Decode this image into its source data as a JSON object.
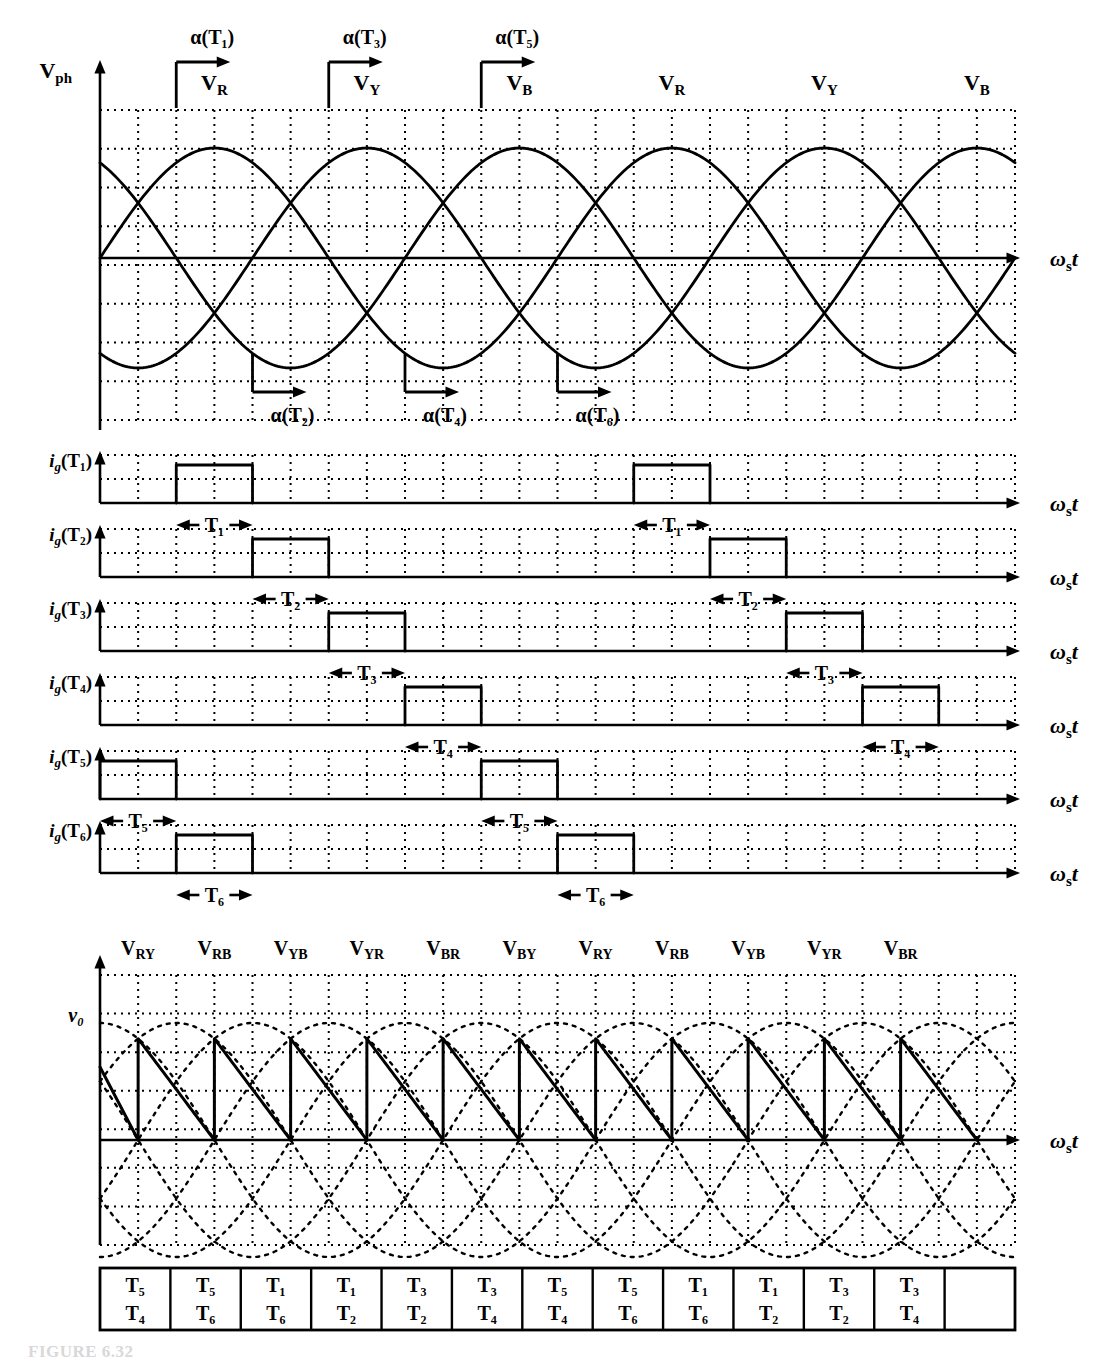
{
  "figure": {
    "caption": "FIGURE 6.32",
    "axis_label": "ωₛt",
    "phase_axis_label": "V",
    "phase_axis_sub": "ph",
    "output_label": "v₀"
  },
  "chart_data": {
    "type": "line",
    "xlabel": "ωₛt",
    "ylabel": "V_ph",
    "grid": true,
    "legend": "none",
    "x_range_deg": [
      0,
      720
    ],
    "phase_waveforms": {
      "amplitude": 1.0,
      "series": [
        {
          "name": "V_R",
          "phase_deg": 0
        },
        {
          "name": "V_Y",
          "phase_deg": -120
        },
        {
          "name": "V_B",
          "phase_deg": -240
        }
      ],
      "peak_labels": [
        "V_R",
        "V_Y",
        "V_B",
        "V_R",
        "V_Y",
        "V_B"
      ],
      "peak_positions_deg": [
        90,
        210,
        330,
        450,
        570,
        690
      ]
    },
    "firing_angles": {
      "alpha_deg": 30,
      "upper_group": [
        {
          "label": "α(T₁)",
          "at_deg": 60
        },
        {
          "label": "α(T₃)",
          "at_deg": 180
        },
        {
          "label": "α(T₅)",
          "at_deg": 300
        }
      ],
      "lower_group": [
        {
          "label": "α(T₂)",
          "at_deg": 120
        },
        {
          "label": "α(T₄)",
          "at_deg": 240
        },
        {
          "label": "α(T₆)",
          "at_deg": 360
        }
      ]
    },
    "gate_pulses": {
      "rows": [
        {
          "label_main": "i",
          "label_sub": "g",
          "label_arg": "(T₁)",
          "name": "ig-T1",
          "duration_label": "T₁",
          "pulses_deg": [
            [
              60,
              120
            ],
            [
              420,
              480
            ]
          ]
        },
        {
          "label_main": "i",
          "label_sub": "g",
          "label_arg": "(T₂)",
          "name": "ig-T2",
          "duration_label": "T₂",
          "pulses_deg": [
            [
              120,
              180
            ],
            [
              480,
              540
            ]
          ]
        },
        {
          "label_main": "i",
          "label_sub": "g",
          "label_arg": "(T₃)",
          "name": "ig-T3",
          "duration_label": "T₃",
          "pulses_deg": [
            [
              180,
              240
            ],
            [
              540,
              600
            ]
          ]
        },
        {
          "label_main": "i",
          "label_sub": "g",
          "label_arg": "(T₄)",
          "name": "ig-T4",
          "duration_label": "T₄",
          "pulses_deg": [
            [
              240,
              300
            ],
            [
              600,
              660
            ]
          ]
        },
        {
          "label_main": "i",
          "label_sub": "g",
          "label_arg": "(T₅)",
          "name": "ig-T5",
          "duration_label": "T₅",
          "pulses_deg": [
            [
              0,
              60
            ],
            [
              300,
              360
            ]
          ]
        },
        {
          "label_main": "i",
          "label_sub": "g",
          "label_arg": "(T₆)",
          "name": "ig-T6",
          "duration_label": "T₆",
          "pulses_deg": [
            [
              60,
              120
            ],
            [
              360,
              420
            ]
          ]
        }
      ]
    },
    "line_voltage_segments": [
      "V_RY",
      "V_RB",
      "V_YB",
      "V_YR",
      "V_BR",
      "V_BY",
      "V_RY",
      "V_RB",
      "V_YB",
      "V_YR",
      "V_BR"
    ],
    "output_voltage": {
      "name": "v₀",
      "description": "Rectified output with firing delay α = 30°; sawtooth pulses on line-to-line sinusoid envelopes",
      "pulse_count": 11,
      "dotted_envelope": "six line-to-line sinusoids"
    },
    "conduction_table": {
      "rows": 2,
      "cells": [
        {
          "top": "T₅",
          "bottom": "T₄"
        },
        {
          "top": "T₅",
          "bottom": "T₆"
        },
        {
          "top": "T₁",
          "bottom": "T₆"
        },
        {
          "top": "T₁",
          "bottom": "T₂"
        },
        {
          "top": "T₃",
          "bottom": "T₂"
        },
        {
          "top": "T₃",
          "bottom": "T₄"
        },
        {
          "top": "T₅",
          "bottom": "T₄"
        },
        {
          "top": "T₅",
          "bottom": "T₆"
        },
        {
          "top": "T₁",
          "bottom": "T₆"
        },
        {
          "top": "T₁",
          "bottom": "T₂"
        },
        {
          "top": "T₃",
          "bottom": "T₂"
        },
        {
          "top": "T₃",
          "bottom": "T₄"
        },
        {
          "top": "",
          "bottom": ""
        }
      ]
    }
  },
  "labels": {
    "vph": {
      "main": "V",
      "sub": "ph"
    },
    "v0": "v₀",
    "omega": "ω",
    "omega_sub": "s",
    "omega_t": "t",
    "alpha_T1": "α(T₁)",
    "alpha_T2": "α(T₂)",
    "alpha_T3": "α(T₃)",
    "alpha_T4": "α(T₄)",
    "alpha_T5": "α(T₅)",
    "alpha_T6": "α(T₆)"
  },
  "colors": {
    "line": "#000000",
    "grid": "#2b2b2b",
    "background": "#ffffff"
  }
}
